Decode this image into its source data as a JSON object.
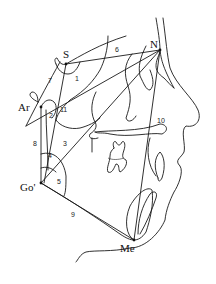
{
  "diagram": {
    "type": "cephalometric-tracing",
    "landmarks": [
      {
        "id": "S",
        "label": "S",
        "x": 66,
        "y": 64
      },
      {
        "id": "N",
        "label": "N",
        "x": 160,
        "y": 50
      },
      {
        "id": "Ar",
        "label": "Ar",
        "x": 41,
        "y": 107
      },
      {
        "id": "Go",
        "label": "Go'",
        "x": 41,
        "y": 183
      },
      {
        "id": "Me",
        "label": "Me",
        "x": 134,
        "y": 240
      }
    ],
    "measurements": [
      {
        "id": "1",
        "label": "1"
      },
      {
        "id": "2",
        "label": "2"
      },
      {
        "id": "3",
        "label": "3"
      },
      {
        "id": "4",
        "label": "4"
      },
      {
        "id": "5",
        "label": "5"
      },
      {
        "id": "6",
        "label": "6"
      },
      {
        "id": "7",
        "label": "7"
      },
      {
        "id": "8",
        "label": "8"
      },
      {
        "id": "9",
        "label": "9"
      },
      {
        "id": "10",
        "label": "10"
      },
      {
        "id": "11",
        "label": "11"
      }
    ],
    "colors": {
      "line": "#1a1a1a",
      "background": "#ffffff"
    }
  }
}
